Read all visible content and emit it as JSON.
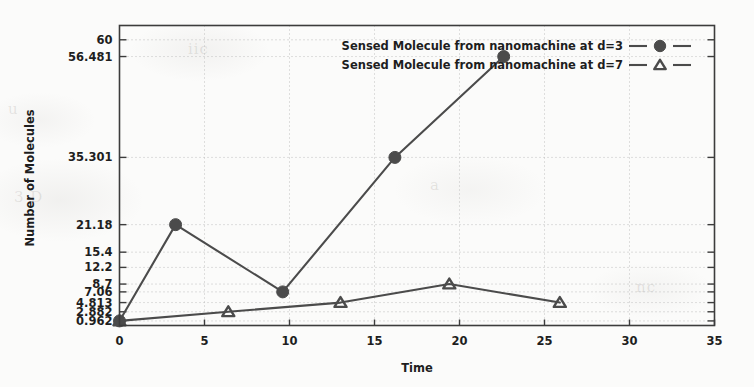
{
  "chart_data": {
    "type": "line",
    "title": "",
    "xlabel": "Time",
    "ylabel": "Number of Molecules",
    "xlim": [
      0,
      35
    ],
    "ylim": [
      0,
      63
    ],
    "grid": true,
    "legend_position": "top-right",
    "xticks": [
      0,
      5,
      10,
      15,
      20,
      25,
      30,
      35
    ],
    "xtick_labels": [
      "0",
      "5",
      "10",
      "15",
      "20",
      "25",
      "30",
      "35"
    ],
    "yticks": [
      60,
      56.481,
      35.301,
      21.18,
      15.4,
      12.2,
      8.7,
      7.06,
      4.813,
      2.882,
      0.962
    ],
    "ytick_labels": [
      "60",
      "56.481",
      "35.301",
      "21.18",
      "15.4",
      "12.2",
      "8.7",
      "7.06",
      "4.813",
      "2.882",
      "0.962"
    ],
    "series": [
      {
        "name": "Sensed Molecule from nanomachine at d=3",
        "marker": "circle",
        "color": "#4b4b4b",
        "x": [
          0,
          3.3,
          9.6,
          16.2,
          22.6
        ],
        "y": [
          0.962,
          21.18,
          7.06,
          35.301,
          56.481
        ]
      },
      {
        "name": "Sensed Molecule from nanomachine at d=7",
        "marker": "triangle",
        "color": "#4b4b4b",
        "x": [
          0,
          6.4,
          13.0,
          19.4,
          25.9
        ],
        "y": [
          0.962,
          2.882,
          4.813,
          8.7,
          4.813
        ]
      }
    ]
  },
  "legend": {
    "entries": [
      {
        "label": "Sensed Molecule from nanomachine at d=3",
        "marker": "circle-marker"
      },
      {
        "label": "Sensed Molecule from nanomachine at d=7",
        "marker": "triangle-marker"
      }
    ]
  },
  "axes": {
    "x_axis_label": "Time",
    "y_axis_label": "Number of Molecules"
  },
  "colors": {
    "line": "#4b4b4b",
    "axis": "#3c3c3c",
    "grid": "#b9b9b9",
    "text": "#1e1e1e",
    "background": "#fbfbfa"
  },
  "ghost_artifacts": [
    {
      "text": "3 D",
      "x": 14,
      "y": 196
    },
    {
      "text": "iic",
      "x": 188,
      "y": 48
    },
    {
      "text": "a",
      "x": 430,
      "y": 184
    },
    {
      "text": "nc",
      "x": 636,
      "y": 286
    },
    {
      "text": "u",
      "x": 8,
      "y": 108
    }
  ]
}
